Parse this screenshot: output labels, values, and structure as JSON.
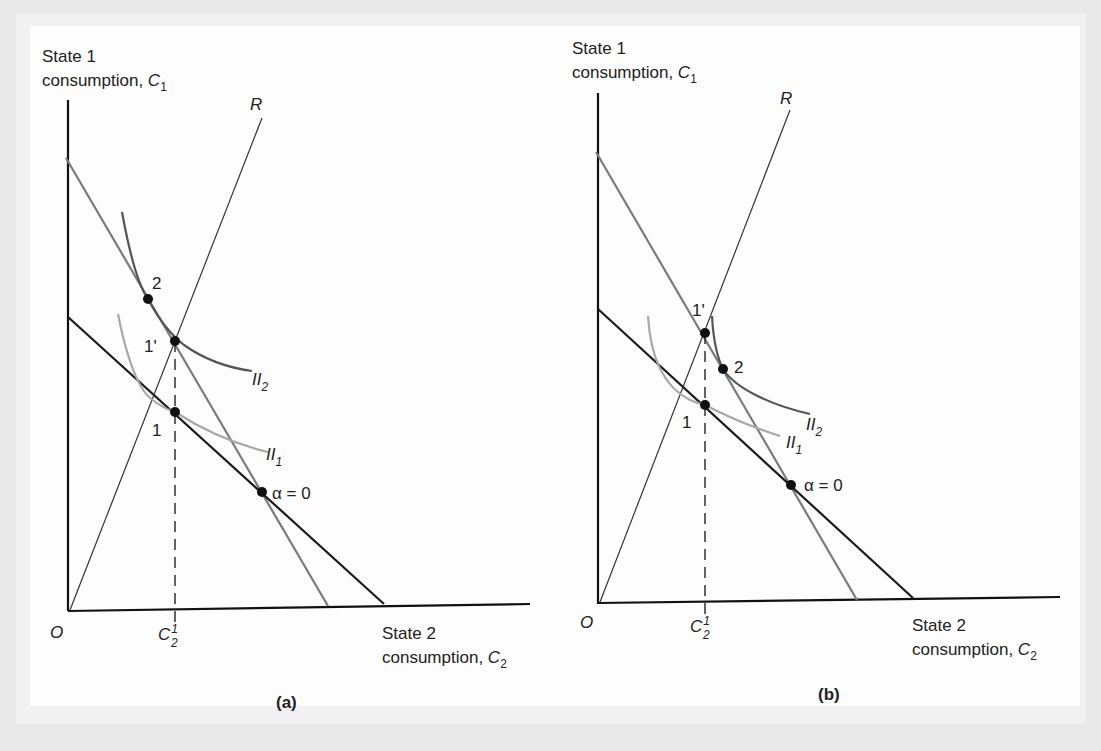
{
  "figure": {
    "panels": [
      {
        "id": "a",
        "caption": "(a)",
        "y_axis_label_line1": "State 1",
        "y_axis_label_line2": "consumption, ",
        "y_axis_var": "C",
        "y_axis_sub": "1",
        "x_axis_label_line1": "State 2",
        "x_axis_label_line2": "consumption, ",
        "x_axis_var": "C",
        "x_axis_sub": "2",
        "origin_label": "O",
        "ray_label": "R",
        "tick_label_var": "C",
        "tick_label_sub": "2",
        "tick_label_sup": "1",
        "points": {
          "p2": "2",
          "p1prime": "1'",
          "p1": "1",
          "alpha0": "α = 0"
        },
        "curves": {
          "ii2": "II",
          "ii2_sub": "2",
          "ii1": "II",
          "ii1_sub": "1"
        }
      },
      {
        "id": "b",
        "caption": "(b)",
        "y_axis_label_line1": "State 1",
        "y_axis_label_line2": "consumption, ",
        "y_axis_var": "C",
        "y_axis_sub": "1",
        "x_axis_label_line1": "State 2",
        "x_axis_label_line2": "consumption, ",
        "x_axis_var": "C",
        "x_axis_sub": "2",
        "origin_label": "O",
        "ray_label": "R",
        "tick_label_var": "C",
        "tick_label_sub": "2",
        "tick_label_sup": "1",
        "points": {
          "p1prime": "1'",
          "p2": "2",
          "p1": "1",
          "alpha0": "α = 0"
        },
        "curves": {
          "ii2": "II",
          "ii2_sub": "2",
          "ii1": "II",
          "ii1_sub": "1"
        }
      }
    ],
    "colors": {
      "axis": "#111111",
      "budget_black": "#1a1a1a",
      "budget_grey": "#7a7a7a",
      "ii2": "#555555",
      "ii1": "#a8a8a8",
      "ray": "#333333"
    }
  }
}
